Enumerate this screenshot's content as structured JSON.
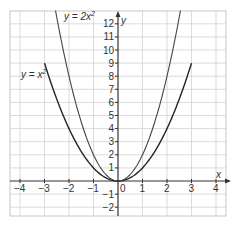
{
  "chart_data": {
    "type": "line",
    "title": "",
    "xlabel": "x",
    "ylabel": "y",
    "xlim": [
      -4.4,
      4.4
    ],
    "ylim": [
      -2.7,
      13
    ],
    "grid": true,
    "x_ticks": [
      "-4",
      "-3",
      "-2",
      "-1",
      "0",
      "1",
      "2",
      "3",
      "4"
    ],
    "y_ticks": [
      "-2",
      "-1",
      "1",
      "2",
      "3",
      "4",
      "5",
      "6",
      "7",
      "8",
      "9",
      "10",
      "11",
      "12"
    ],
    "series": [
      {
        "name": "y = x²",
        "label": "y = x",
        "exponent": "2",
        "x": [
          -3,
          -2,
          -1,
          0,
          1,
          2,
          3
        ],
        "values": [
          9,
          4,
          1,
          0,
          1,
          4,
          9
        ]
      },
      {
        "name": "y = 2x²",
        "label": "y = 2x",
        "exponent": "2",
        "x": [
          -2.55,
          -2,
          -1,
          0,
          1,
          2,
          2.55
        ],
        "values": [
          13,
          8,
          2,
          0,
          2,
          8,
          13
        ]
      }
    ],
    "annotations": [
      {
        "text": "y = x²",
        "near": [
          -3,
          9
        ]
      },
      {
        "text": "y = 2x²",
        "near": [
          -2.55,
          13
        ]
      }
    ]
  },
  "labels": {
    "x_axis": "x",
    "y_axis": "y",
    "curve1_main": "y = x",
    "curve1_sup": "2",
    "curve2_main": "y = 2x",
    "curve2_sup": "2"
  }
}
